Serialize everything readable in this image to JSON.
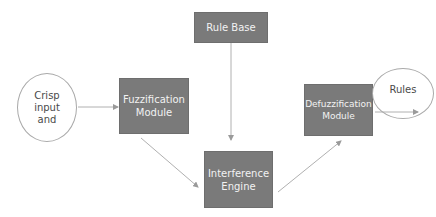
{
  "diagram": {
    "title": "",
    "nodes": {
      "crisp_input": {
        "label": "Crisp\ninput\nand",
        "shape": "ellipse"
      },
      "fuzzification": {
        "label": "Fuzzification\nModule",
        "shape": "rect"
      },
      "rule_base": {
        "label": "Rule Base",
        "shape": "rect"
      },
      "interference": {
        "label": "Interference\nEngine",
        "shape": "rect"
      },
      "defuzzification": {
        "label": "Defuzzification\nModule",
        "shape": "rect"
      },
      "rules": {
        "label": "Rules",
        "shape": "ellipse"
      }
    },
    "edges": [
      {
        "from": "crisp_input",
        "to": "fuzzification"
      },
      {
        "from": "fuzzification",
        "to": "interference"
      },
      {
        "from": "rule_base",
        "to": "interference"
      },
      {
        "from": "interference",
        "to": "defuzzification"
      },
      {
        "from": "defuzzification",
        "to": "output"
      }
    ],
    "colors": {
      "box_fill": "#7a7a7a",
      "box_text": "#f2f2f2",
      "line": "#b0b0b0",
      "ellipse_stroke": "#a9a9a9"
    }
  }
}
